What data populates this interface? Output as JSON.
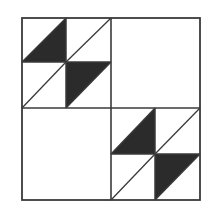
{
  "diagram": {
    "colors": {
      "background": "#ffffff",
      "line": "#3a3a3a",
      "fill": "#2b2b2b"
    },
    "outer_square": {
      "x": 22,
      "y": 18,
      "w": 178,
      "h": 182
    },
    "blocks": [
      {
        "name": "upper-left-pinwheel-block",
        "x0": 22,
        "y0": 18,
        "xm": 66,
        "ym": 62,
        "x1": 111,
        "y1": 108
      },
      {
        "name": "lower-right-pinwheel-block",
        "x0": 111,
        "y0": 108,
        "xm": 155,
        "ym": 154,
        "x1": 200,
        "y1": 200
      }
    ],
    "empty_blocks": [
      "upper-right-plain-square",
      "lower-left-plain-square"
    ]
  }
}
